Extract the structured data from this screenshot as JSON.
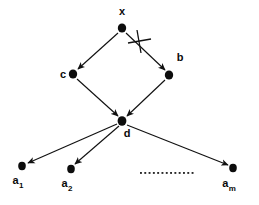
{
  "figure": {
    "type": "directed-graph",
    "background_color": "#ffffff",
    "ink_color": "#111111"
  },
  "nodes": [
    {
      "id": "x",
      "label": "x",
      "subscript": "",
      "cx": 122,
      "cy": 28,
      "rx": 4.2,
      "ry": 4.6,
      "label_x": 122,
      "label_y": 15,
      "label_anchor": "middle"
    },
    {
      "id": "c",
      "label": "c",
      "subscript": "",
      "cx": 73,
      "cy": 74,
      "rx": 4.2,
      "ry": 4.6,
      "label_x": 63,
      "label_y": 78,
      "label_anchor": "middle"
    },
    {
      "id": "b",
      "label": "b",
      "subscript": "",
      "cx": 169,
      "cy": 75,
      "rx": 4.2,
      "ry": 4.6,
      "label_x": 180,
      "label_y": 61,
      "label_anchor": "middle"
    },
    {
      "id": "d",
      "label": "d",
      "subscript": "",
      "cx": 122,
      "cy": 121,
      "rx": 4.4,
      "ry": 4.8,
      "label_x": 127,
      "label_y": 137,
      "label_anchor": "middle"
    },
    {
      "id": "a1",
      "label": "a",
      "subscript": "1",
      "cx": 22,
      "cy": 166,
      "rx": 3.8,
      "ry": 4.2,
      "label_x": 18,
      "label_y": 184,
      "label_anchor": "middle"
    },
    {
      "id": "a2",
      "label": "a",
      "subscript": "2",
      "cx": 71,
      "cy": 169,
      "rx": 3.8,
      "ry": 4.2,
      "label_x": 67,
      "label_y": 187,
      "label_anchor": "middle"
    },
    {
      "id": "am",
      "label": "a",
      "subscript": "m",
      "cx": 233,
      "cy": 168,
      "rx": 3.8,
      "ry": 4.2,
      "label_x": 229,
      "label_y": 187,
      "label_anchor": "middle"
    }
  ],
  "edges": [
    {
      "id": "x-c",
      "from": "x",
      "to": "c",
      "x1": 118,
      "y1": 33,
      "x2": 78,
      "y2": 69,
      "struck": false
    },
    {
      "id": "x-b",
      "from": "x",
      "to": "b",
      "x1": 126,
      "y1": 33,
      "x2": 165,
      "y2": 70,
      "struck": true
    },
    {
      "id": "c-d",
      "from": "c",
      "to": "d",
      "x1": 77,
      "y1": 79,
      "x2": 118,
      "y2": 116,
      "struck": false
    },
    {
      "id": "b-d",
      "from": "b",
      "to": "d",
      "x1": 165,
      "y1": 80,
      "x2": 127,
      "y2": 116,
      "struck": false
    },
    {
      "id": "d-a1",
      "from": "d",
      "to": "a1",
      "x1": 117,
      "y1": 124,
      "x2": 28,
      "y2": 163,
      "struck": false
    },
    {
      "id": "d-a2",
      "from": "d",
      "to": "a2",
      "x1": 119,
      "y1": 126,
      "x2": 75,
      "y2": 164,
      "struck": false
    },
    {
      "id": "d-am",
      "from": "d",
      "to": "am",
      "x1": 127,
      "y1": 125,
      "x2": 228,
      "y2": 165,
      "struck": false
    }
  ],
  "strike_mark": {
    "id": "x-b-strike",
    "label": "cross-out",
    "center_x": 139,
    "center_y": 41,
    "v_x1": 137,
    "v_y1": 30,
    "v_x2": 141,
    "v_y2": 53,
    "h_x1": 128,
    "h_y1": 43,
    "h_x2": 151,
    "h_y2": 39
  },
  "ellipsis": {
    "label": "continuation-dots",
    "count": 13,
    "start_x": 140,
    "y": 172,
    "spacing": 4.3,
    "dot_size": 1.9
  }
}
